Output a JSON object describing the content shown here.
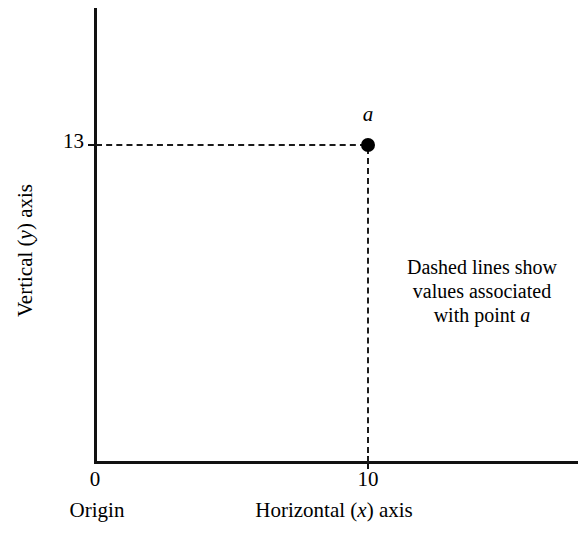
{
  "chart_data": {
    "type": "scatter",
    "title": "",
    "xlabel": "Horizontal (x) axis",
    "ylabel": "Vertical (y) axis",
    "xlim": [
      0,
      17
    ],
    "ylim": [
      0,
      22
    ],
    "grid": false,
    "legend": "none",
    "x_tick_labels": [
      "0",
      "10"
    ],
    "y_tick_labels": [
      "13"
    ],
    "origin_label": "Origin",
    "points": [
      {
        "label": "a",
        "x": 10,
        "y": 13,
        "marker": "filled-circle",
        "color": "#000000"
      }
    ],
    "annotations": [
      {
        "name": "dashed-line-note",
        "lines": [
          "Dashed lines show",
          "values associated",
          "with point "
        ],
        "emphasis": "a"
      }
    ],
    "guides": [
      {
        "name": "horizontal-dashed-guide",
        "from": "y-axis",
        "to": "point-a",
        "value": 13,
        "style": "dashed"
      },
      {
        "name": "vertical-dashed-guide",
        "from": "point-a",
        "to": "x-axis",
        "value": 10,
        "style": "dashed"
      }
    ]
  },
  "axes": {
    "y_title_prefix": "Vertical (",
    "y_title_var": "y",
    "y_title_suffix": ") axis",
    "x_title_prefix": "Horizontal (",
    "x_title_var": "x",
    "x_title_suffix": ") axis",
    "y_tick_value": "13",
    "x_tick_value": "10",
    "zero_label": "0",
    "origin_label": "Origin"
  },
  "point": {
    "label": "a"
  },
  "annotation": {
    "line1": "Dashed lines show",
    "line2": "values associated",
    "line3_prefix": "with point ",
    "line3_var": "a"
  },
  "colors": {
    "axis": "#111111",
    "dash": "#1a1a1a",
    "point": "#000000",
    "background": "#ffffff",
    "text": "#000000"
  }
}
